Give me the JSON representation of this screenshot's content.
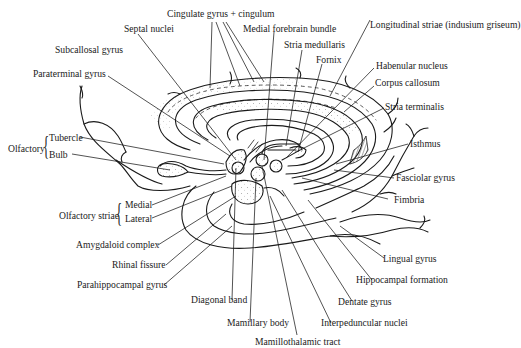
{
  "diagram": {
    "labels": {
      "cingulate": "Cingulate gyrus + cingulum",
      "septal_nuclei": "Septal nuclei",
      "medial_forebrain_bundle": "Medial forebrain bundle",
      "longitudinal_striae": "Longitudinal striae (indusium griseum)",
      "subcallosal_gyrus": "Subcallosal gyrus",
      "stria_medullaris": "Stria medullaris",
      "fornix": "Fornix",
      "habenular_nucleus": "Habenular nucleus",
      "paraterminal_gyrus": "Paraterminal gyrus",
      "corpus_callosum": "Corpus callosum",
      "stria_terminalis": "Stria terminalis",
      "olfactory": "Olfactory",
      "tubercle": "Tubercle",
      "bulb": "Bulb",
      "isthmus": "Isthmus",
      "fasciolar_gyrus": "Fasciolar gyrus",
      "fimbria": "Fimbria",
      "olfactory_striae": "Olfactory striae",
      "medial": "Medial",
      "lateral": "Lateral",
      "amygdaloid_complex": "Amygdaloid complex",
      "rhinal_fissure": "Rhinal fissure",
      "lingual_gyrus": "Lingual gyrus",
      "hippocampal_formation": "Hippocampal formation",
      "parahippocampal_gyrus": "Parahippocampal gyrus",
      "dentate_gyrus": "Dentate gyrus",
      "diagonal_band": "Diagonal band",
      "mamillary_body": "Mamillary body",
      "interpeduncular_nuclei": "Interpeduncular nuclei",
      "mamillothalamic_tract": "Mamillothalamic tract"
    },
    "colors": {
      "ink": "#1a1a1a",
      "background": "#ffffff",
      "hatch": "#555555"
    }
  }
}
